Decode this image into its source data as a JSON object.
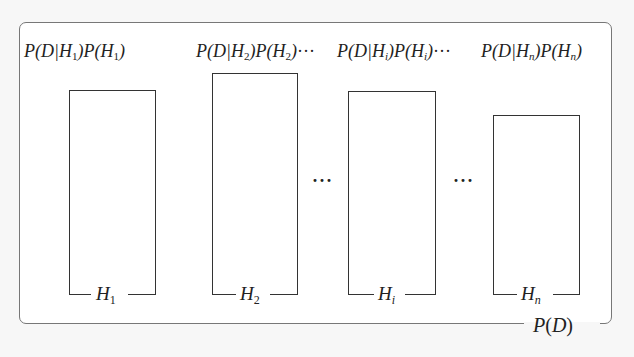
{
  "diagram": {
    "title": "",
    "container_label": {
      "fn": "P",
      "arg": "D",
      "text": "P(D)"
    },
    "top_labels": [
      {
        "text": "P(D|H1)P(H1)",
        "sub": "1",
        "sub_italic": false,
        "trailing": ""
      },
      {
        "text": "P(D|H2)P(H2)···",
        "sub": "2",
        "sub_italic": false,
        "trailing": "···"
      },
      {
        "text": "P(D|Hi)P(Hi)···",
        "sub": "i",
        "sub_italic": true,
        "trailing": "···"
      },
      {
        "text": "P(D|Hn)P(Hn)",
        "sub": "n",
        "sub_italic": true,
        "trailing": ""
      }
    ],
    "hypotheses": [
      {
        "label": "H1",
        "base": "H",
        "sub": "1",
        "sub_italic": false,
        "relative_height": 205
      },
      {
        "label": "H2",
        "base": "H",
        "sub": "2",
        "sub_italic": false,
        "relative_height": 222
      },
      {
        "label": "Hi",
        "base": "H",
        "sub": "i",
        "sub_italic": true,
        "relative_height": 204
      },
      {
        "label": "Hn",
        "base": "H",
        "sub": "n",
        "sub_italic": true,
        "relative_height": 180
      }
    ],
    "ellipses": [
      "···",
      "···"
    ],
    "colors": {
      "background": "#f7f7f7",
      "frame": "#777777",
      "stroke": "#333333",
      "text": "#222222"
    }
  }
}
